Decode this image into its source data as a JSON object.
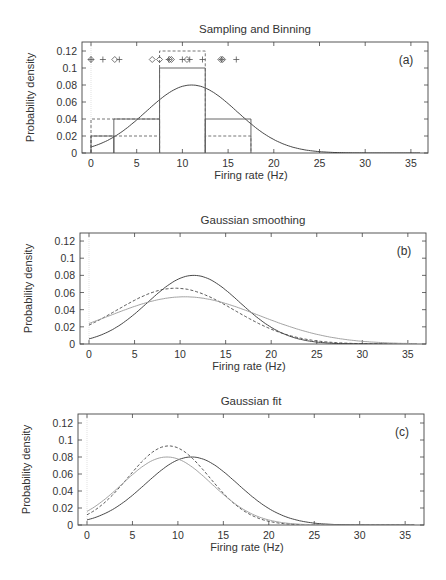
{
  "chart_data": [
    {
      "type": "line",
      "panel": "(a)",
      "title": "Sampling and Binning",
      "xlabel": "Firing rate (Hz)",
      "ylabel": "Probability density",
      "xlim": [
        -1,
        37
      ],
      "ylim": [
        0,
        0.13
      ],
      "xticks": [
        0,
        5,
        10,
        15,
        20,
        25,
        30,
        35
      ],
      "yticks": [
        "0",
        "0.02",
        "0.04",
        "0.06",
        "0.08",
        "0.1",
        "0.12"
      ],
      "grid": false,
      "series": [
        {
          "name": "true density (solid curve)",
          "style": "solid",
          "gaussian": {
            "mean": 11,
            "sd": 5,
            "peak": 0.08
          }
        },
        {
          "name": "histogram A (solid steps)",
          "style": "solid-step",
          "bins": [
            [
              0,
              2.5,
              0.02
            ],
            [
              2.5,
              7.5,
              0.04
            ],
            [
              7.5,
              12.5,
              0.1
            ],
            [
              12.5,
              17.5,
              0.04
            ]
          ]
        },
        {
          "name": "histogram B (dashed steps)",
          "style": "dashed-step",
          "bins": [
            [
              0,
              7.5,
              0.04
            ],
            [
              0,
              7.5,
              0.02
            ],
            [
              7.5,
              12.5,
              0.12
            ],
            [
              12.5,
              17.5,
              0.02
            ]
          ]
        },
        {
          "name": "sample set 1 (diamonds)",
          "marker": "diamond",
          "y": 0.11,
          "x": [
            0,
            2.6,
            6.7,
            7.5,
            8.6,
            8.8,
            10.5,
            14.2,
            14.4
          ]
        },
        {
          "name": "sample set 2 (plus)",
          "marker": "plus",
          "y": 0.11,
          "x": [
            0,
            1.3,
            3.1,
            8.5,
            10.0,
            10.8,
            12.2,
            14.3,
            15.9
          ]
        }
      ]
    },
    {
      "type": "line",
      "panel": "(b)",
      "title": "Gaussian smoothing",
      "xlabel": "Firing rate (Hz)",
      "ylabel": "Probability density",
      "xlim": [
        -1,
        37
      ],
      "ylim": [
        0,
        0.13
      ],
      "xticks": [
        0,
        5,
        10,
        15,
        20,
        25,
        30,
        35
      ],
      "yticks": [
        "0",
        "0.02",
        "0.04",
        "0.06",
        "0.08",
        "0.1",
        "0.12"
      ],
      "series": [
        {
          "name": "true density",
          "style": "solid",
          "peak_x": 11.5,
          "peak_y": 0.08,
          "y_at_0": 0.006
        },
        {
          "name": "smoothed estimate 1",
          "style": "dashed",
          "peak_x": 9.5,
          "peak_y": 0.065,
          "y_at_0": 0.022
        },
        {
          "name": "smoothed estimate 2",
          "style": "dotted",
          "peak_x": 10.5,
          "peak_y": 0.055,
          "y_at_0": 0.024
        }
      ]
    },
    {
      "type": "line",
      "panel": "(c)",
      "title": "Gaussian fit",
      "xlabel": "Firing rate (Hz)",
      "ylabel": "Probability density",
      "xlim": [
        -1,
        37
      ],
      "ylim": [
        0,
        0.13
      ],
      "xticks": [
        0,
        5,
        10,
        15,
        20,
        25,
        30,
        35
      ],
      "yticks": [
        "0",
        "0.02",
        "0.04",
        "0.06",
        "0.08",
        "0.1",
        "0.12"
      ],
      "series": [
        {
          "name": "true density",
          "style": "solid",
          "peak_x": 11.5,
          "peak_y": 0.08,
          "y_at_0": 0.006
        },
        {
          "name": "fit 1",
          "style": "dashed",
          "peak_x": 9,
          "peak_y": 0.093,
          "y_at_0": 0.012
        },
        {
          "name": "fit 2",
          "style": "dotted",
          "peak_x": 8.8,
          "peak_y": 0.08,
          "y_at_0": 0.016
        }
      ]
    }
  ],
  "panels": [
    {
      "title": "Sampling and Binning",
      "label": "(a)",
      "xlabel": "Firing rate (Hz)",
      "ylabel": "Probability density"
    },
    {
      "title": "Gaussian smoothing",
      "label": "(b)",
      "xlabel": "Firing rate (Hz)",
      "ylabel": "Probability density"
    },
    {
      "title": "Gaussian fit",
      "label": "(c)",
      "xlabel": "Firing rate (Hz)",
      "ylabel": "Probability density"
    }
  ],
  "ticks": {
    "x": [
      "0",
      "5",
      "10",
      "15",
      "20",
      "25",
      "30",
      "35"
    ],
    "y": [
      "0",
      "0.02",
      "0.04",
      "0.06",
      "0.08",
      "0.1",
      "0.12"
    ]
  }
}
